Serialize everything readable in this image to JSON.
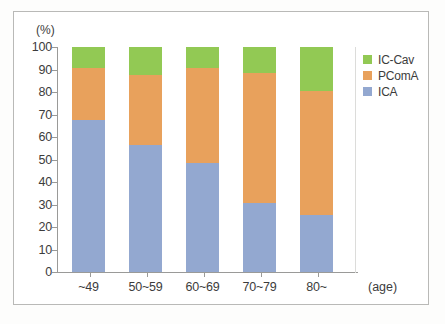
{
  "chart_data": {
    "type": "bar",
    "stacked": true,
    "normalized_percent": true,
    "title": "",
    "subtitle": "",
    "xlabel": "(age)",
    "ylabel": "(%)",
    "categories": [
      "~49",
      "50~59",
      "60~69",
      "70~79",
      "80~"
    ],
    "series": [
      {
        "name": "ICA",
        "color": "#93a8d0",
        "values": [
          67.5,
          56.5,
          48.5,
          30.8,
          25.5
        ]
      },
      {
        "name": "PComA",
        "color": "#e8a15c",
        "values": [
          23.0,
          31.0,
          42.0,
          57.7,
          55.0
        ]
      },
      {
        "name": "IC-Cav",
        "color": "#92c954",
        "values": [
          9.5,
          12.5,
          9.5,
          11.5,
          19.5
        ]
      }
    ],
    "ylim": [
      0,
      100
    ],
    "yticks": [
      0,
      10,
      20,
      30,
      40,
      50,
      60,
      70,
      80,
      90,
      100
    ],
    "ytick_labels": [
      "0",
      "10",
      "20",
      "30",
      "40",
      "50",
      "60",
      "70",
      "80",
      "90",
      "100"
    ],
    "grid": false,
    "legend_position": "right",
    "legend_entries": [
      "IC-Cav",
      "PComA",
      "ICA"
    ]
  },
  "axes": {
    "y_unit_label": "(%)",
    "x_unit_label": "(age)"
  },
  "colors": {
    "ica": "#93a8d0",
    "pcoma": "#e8a15c",
    "iccav": "#92c954",
    "axis": "#9a9a98",
    "frame": "#b9b9b7",
    "text": "#3c3c3c",
    "background": "#ffffff"
  }
}
